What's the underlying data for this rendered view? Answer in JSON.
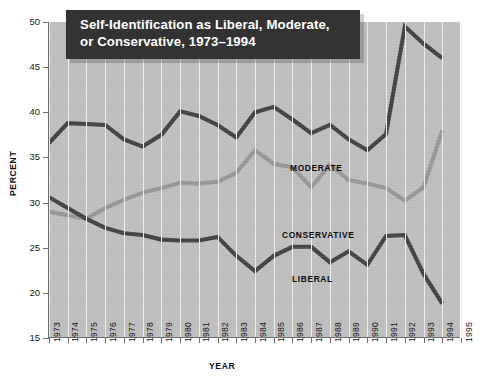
{
  "title": {
    "line1": "Self-Identification as Liberal, Moderate,",
    "line2": "or Conservative, 1973–1994"
  },
  "axes": {
    "ylabel": "PERCENT",
    "xlabel": "YEAR",
    "yticks": [
      "15",
      "20",
      "25",
      "30",
      "35",
      "40",
      "45",
      "50"
    ],
    "xticks": [
      "1973",
      "1974",
      "1975",
      "1976",
      "1977",
      "1978",
      "1979",
      "1980",
      "1981",
      "1982",
      "1983",
      "1984",
      "1985",
      "1986",
      "1987",
      "1988",
      "1989",
      "1990",
      "1991",
      "1992",
      "1993",
      "1994",
      "1995"
    ]
  },
  "series_labels": {
    "moderate": "MODERATE",
    "conservative": "CONSERVATIVE",
    "liberal": "LIBERAL"
  },
  "colors": {
    "plot_background": "#bdbdbd",
    "title_background": "#333333",
    "title_text": "#ffffff",
    "gridline": "#eceaea",
    "axis": "#6e6e6e",
    "moderate": "#434343",
    "conservative": "#969696",
    "liberal": "#434343"
  },
  "chart_data": {
    "type": "line",
    "title": "Self-Identification as Liberal, Moderate, or Conservative, 1973–1994",
    "xlabel": "YEAR",
    "ylabel": "PERCENT",
    "grid": "vertical",
    "legend": "inline-annotations",
    "xlim": [
      1973,
      1995
    ],
    "ylim": [
      15,
      50
    ],
    "ytick_step": 5,
    "x": [
      1973,
      1974,
      1975,
      1976,
      1977,
      1978,
      1979,
      1980,
      1981,
      1982,
      1983,
      1984,
      1985,
      1986,
      1987,
      1988,
      1989,
      1990,
      1991,
      1992,
      1993,
      1994
    ],
    "series": [
      {
        "name": "MODERATE",
        "color": "#434343",
        "values": [
          36.6,
          38.8,
          38.7,
          38.6,
          37.0,
          36.2,
          37.5,
          40.1,
          39.6,
          38.6,
          37.2,
          40.0,
          40.6,
          39.2,
          37.7,
          38.6,
          37.0,
          35.8,
          37.6,
          49.5,
          47.6,
          46.0
        ]
      },
      {
        "name": "CONSERVATIVE",
        "color": "#969696",
        "values": [
          29.0,
          28.6,
          28.2,
          29.4,
          30.3,
          31.1,
          31.6,
          32.2,
          32.1,
          32.3,
          33.3,
          35.8,
          34.3,
          33.9,
          31.7,
          34.2,
          32.5,
          32.1,
          31.6,
          30.2,
          31.7,
          38.0
        ]
      },
      {
        "name": "LIBERAL",
        "color": "#434343",
        "values": [
          30.6,
          29.4,
          28.2,
          27.2,
          26.6,
          26.4,
          25.9,
          25.8,
          25.8,
          26.2,
          24.1,
          22.4,
          24.1,
          25.1,
          25.1,
          23.4,
          24.6,
          23.1,
          26.3,
          26.4,
          22.1,
          18.8
        ]
      }
    ]
  }
}
